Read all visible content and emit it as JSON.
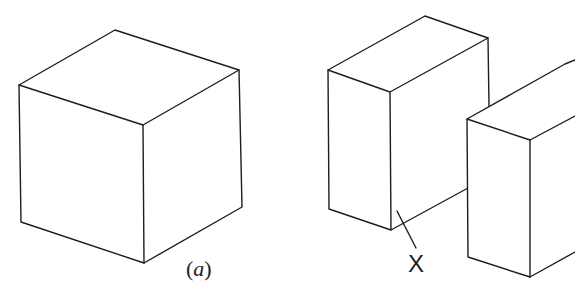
{
  "figure": {
    "panel_a": {
      "label_open": "(",
      "label_letter": "a",
      "label_close": ")"
    },
    "panel_b": {
      "marker_label": "X"
    },
    "colors": {
      "line": "#1e1e1e",
      "background": "#ffffff"
    }
  }
}
